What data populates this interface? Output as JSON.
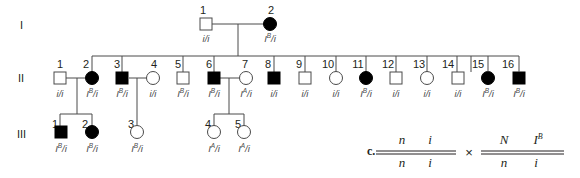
{
  "generations": [
    "I",
    "II",
    "III"
  ],
  "gen1": {
    "individuals": [
      {
        "num": "1",
        "sex": "male",
        "affected": false,
        "genotype_base": "i/i",
        "genotype_sup": ""
      },
      {
        "num": "2",
        "sex": "female",
        "affected": true,
        "genotype_base": "I",
        "genotype_sup": "B",
        "genotype_rest": "/i"
      }
    ]
  },
  "gen2": {
    "individuals": [
      {
        "num": "1",
        "sex": "male",
        "affected": false,
        "g1": "i/i",
        "sup": "",
        "g2": ""
      },
      {
        "num": "2",
        "sex": "female",
        "affected": true,
        "g1": "I",
        "sup": "B",
        "g2": "/i"
      },
      {
        "num": "3",
        "sex": "male",
        "affected": true,
        "g1": "I",
        "sup": "B",
        "g2": "/i"
      },
      {
        "num": "4",
        "sex": "female",
        "affected": false,
        "g1": "i/i",
        "sup": "",
        "g2": ""
      },
      {
        "num": "5",
        "sex": "male",
        "affected": false,
        "g1": "I",
        "sup": "B",
        "g2": "/i"
      },
      {
        "num": "6",
        "sex": "male",
        "affected": true,
        "g1": "I",
        "sup": "B",
        "g2": "/i"
      },
      {
        "num": "7",
        "sex": "female",
        "affected": false,
        "g1": "I",
        "sup": "A",
        "g2": "/i"
      },
      {
        "num": "8",
        "sex": "male",
        "affected": true,
        "g1": "i/i",
        "sup": "",
        "g2": ""
      },
      {
        "num": "9",
        "sex": "male",
        "affected": false,
        "g1": "i/i",
        "sup": "",
        "g2": ""
      },
      {
        "num": "10",
        "sex": "female",
        "affected": false,
        "g1": "i/i",
        "sup": "",
        "g2": ""
      },
      {
        "num": "11",
        "sex": "female",
        "affected": true,
        "g1": "I",
        "sup": "B",
        "g2": "/i"
      },
      {
        "num": "12",
        "sex": "male",
        "affected": false,
        "g1": "i/i",
        "sup": "",
        "g2": ""
      },
      {
        "num": "13",
        "sex": "female",
        "affected": false,
        "g1": "i/i",
        "sup": "",
        "g2": ""
      },
      {
        "num": "14",
        "sex": "male",
        "affected": false,
        "g1": "i/i",
        "sup": "",
        "g2": ""
      },
      {
        "num": "15",
        "sex": "female",
        "affected": true,
        "g1": "I",
        "sup": "B",
        "g2": "/i"
      },
      {
        "num": "16",
        "sex": "male",
        "affected": true,
        "g1": "I",
        "sup": "B",
        "g2": "/i"
      }
    ]
  },
  "gen3": {
    "individuals": [
      {
        "num": "1",
        "sex": "male",
        "affected": true,
        "g1": "I",
        "sup": "B",
        "g2": "/i"
      },
      {
        "num": "2",
        "sex": "female",
        "affected": true,
        "g1": "I",
        "sup": "B",
        "g2": "/i"
      },
      {
        "num": "3",
        "sex": "female",
        "affected": false,
        "g1": "I",
        "sup": "B",
        "g2": "/i"
      },
      {
        "num": "4",
        "sex": "female",
        "affected": false,
        "g1": "I",
        "sup": "A",
        "g2": "/i"
      },
      {
        "num": "5",
        "sex": "female",
        "affected": false,
        "g1": "I",
        "sup": "A",
        "g2": "/i"
      }
    ]
  },
  "cross": {
    "label": "c.",
    "left_top": [
      "n",
      "i"
    ],
    "left_bottom": [
      "n",
      "i"
    ],
    "times": "×",
    "right_top": [
      "N",
      "I",
      "B"
    ],
    "right_bottom": [
      "n",
      "i"
    ]
  }
}
